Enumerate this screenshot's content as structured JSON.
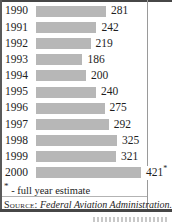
{
  "chart_data": {
    "type": "bar",
    "orientation": "horizontal",
    "title": "",
    "xlabel": "",
    "ylabel": "",
    "categories": [
      "1990",
      "1991",
      "1992",
      "1993",
      "1994",
      "1995",
      "1996",
      "1997",
      "1998",
      "1999",
      "2000"
    ],
    "values": [
      281,
      242,
      219,
      186,
      200,
      240,
      275,
      292,
      325,
      321,
      421
    ],
    "data_labels": [
      "281",
      "242",
      "219",
      "186",
      "200",
      "240",
      "275",
      "292",
      "325",
      "321",
      "421"
    ],
    "markers": [
      "",
      "",
      "",
      "",
      "",
      "",
      "",
      "",
      "",
      "",
      "*"
    ],
    "xlim": [
      0,
      421
    ],
    "grid": false,
    "legend": "none",
    "bar_color": "#b7b7b7"
  },
  "footnote": {
    "marker": "*",
    "text": "- full year estimate"
  },
  "source": {
    "label": "Source:",
    "text": "Federal Aviation Administration."
  },
  "colors": {
    "bar": "#b7b7b7",
    "border_dark": "#474747",
    "border_light": "#9a9a9a",
    "text": "#1e1e1e"
  }
}
